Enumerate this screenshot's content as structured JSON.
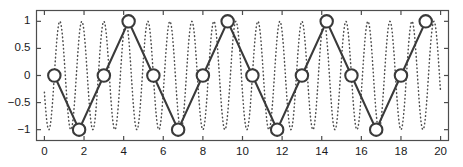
{
  "figure": {
    "background_color": "#ffffff",
    "axes_color": "#4d4d4d",
    "signal_color": "#4d4d4d",
    "sampled_color": "#3a3a3a",
    "marker_face_color": "#ffffff"
  },
  "chart_data": {
    "type": "line",
    "title": "",
    "subtitle": "",
    "xlabel": "",
    "ylabel": "",
    "xlim": [
      -0.4,
      20.4
    ],
    "ylim": [
      -1.2,
      1.2
    ],
    "grid": false,
    "legend": null,
    "xticks": [
      0,
      2,
      4,
      6,
      8,
      10,
      12,
      14,
      16,
      18,
      20
    ],
    "xticklabels": [
      "0",
      "2",
      "4",
      "6",
      "8",
      "10",
      "12",
      "14",
      "16",
      "18",
      "20"
    ],
    "yticks": [
      -1,
      -0.5,
      0,
      0.5,
      1
    ],
    "yticklabels": [
      "−1",
      "−0.5",
      "0",
      "0.5",
      "1"
    ],
    "series": [
      {
        "name": "original-signal",
        "style": "dotted",
        "marker": "none",
        "description": "High-frequency sine wave drawn as a dotted curve",
        "formula": "sin(2*pi*0.9*(x-0.5))",
        "frequency_cycles_per_unit": 0.9,
        "amplitude": 1,
        "phase_offset": 0.5,
        "x_start": 0,
        "x_end": 20,
        "samples": 1400
      },
      {
        "name": "aliased-sampled-signal",
        "style": "solid",
        "marker": "circle",
        "description": "Samples taken at 0.8 per unit produce a low-frequency aliased waveform",
        "formula": "sin(2*pi*0.1*(x-0.5))",
        "frequency_cycles_per_unit": 0.1,
        "sample_spacing": 1.25,
        "x": [
          0.5,
          1.75,
          3.0,
          4.25,
          5.5,
          6.75,
          8.0,
          9.25,
          10.5,
          11.75,
          13.0,
          14.25,
          15.5,
          16.75,
          18.0,
          19.25
        ],
        "y": [
          0,
          -1,
          0,
          1,
          0,
          -1,
          0,
          1,
          0,
          -1,
          0,
          1,
          0,
          -1,
          0,
          1
        ]
      }
    ]
  }
}
